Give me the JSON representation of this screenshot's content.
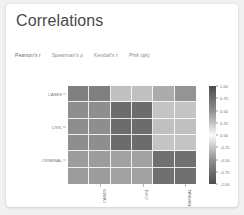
{
  "card": {
    "title": "Correlations"
  },
  "tabs": [
    {
      "label": "Pearson's r",
      "active": true
    },
    {
      "label": "Spearman's ρ",
      "active": false
    },
    {
      "label": "Kendall's τ",
      "active": false
    },
    {
      "label": "Phik (φk)",
      "active": false
    }
  ],
  "colors": {
    "page_background": "#f1f1f1",
    "card_background": "#ffffff",
    "title_text": "#4a4a4a",
    "tab_text": "#8d8d8d",
    "axis_text": "#6b6b6b",
    "grid_line": "#ffffff"
  },
  "chart_data": {
    "type": "heatmap",
    "title": "Correlations",
    "xlabel": "",
    "ylabel": "",
    "grid": true,
    "legend_position": "right",
    "colorbar": {
      "label": "",
      "vmin": -1.0,
      "vmax": 1.0,
      "ticks": [
        1.0,
        0.75,
        0.5,
        0.25,
        0.0,
        -0.25,
        -0.5,
        -0.75,
        -1.0
      ],
      "tick_labels": [
        "1.00",
        "0.75",
        "0.50",
        "0.25",
        "0.00",
        "-0.25",
        "-0.50",
        "-0.75",
        "-1.00"
      ],
      "colormap": "diverging-gray"
    },
    "x_tick_labels": [
      "CASES",
      "CIVIL",
      "CRIMINAL"
    ],
    "y_tick_labels": [
      "CASES",
      "CIVIL",
      "CRIMINAL"
    ],
    "x_tick_positions": [
      1,
      3,
      5
    ],
    "y_tick_positions": [
      0,
      2,
      4
    ],
    "n_rows": 6,
    "n_cols": 6,
    "values": [
      [
        -0.62,
        -0.62,
        -0.3,
        -0.3,
        -0.4,
        -0.52
      ],
      [
        -0.55,
        -0.55,
        -0.72,
        -0.72,
        0.28,
        0.28
      ],
      [
        -0.55,
        -0.55,
        -0.72,
        -0.72,
        0.3,
        0.3
      ],
      [
        -0.55,
        -0.55,
        -0.72,
        -0.72,
        0.28,
        0.28
      ],
      [
        -0.48,
        -0.48,
        0.45,
        0.45,
        -0.7,
        -0.7
      ],
      [
        -0.48,
        -0.48,
        0.45,
        0.45,
        -0.7,
        -0.7
      ]
    ]
  }
}
